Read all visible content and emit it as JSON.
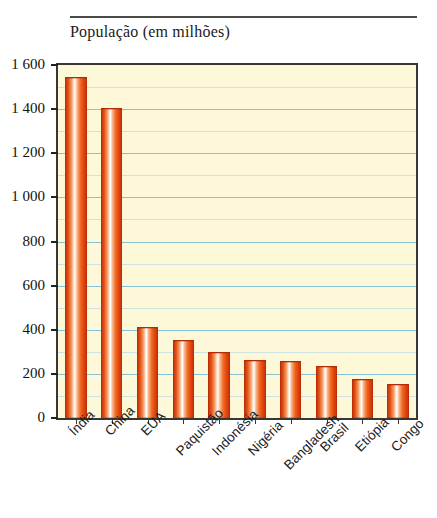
{
  "figure": {
    "title": "População (em milhões)"
  },
  "chart_data": {
    "type": "bar",
    "title": "População (em milhões)",
    "xlabel": "",
    "ylabel": "População (em milhões)",
    "ylim": [
      0,
      1600
    ],
    "ytick_step": 200,
    "minor_gridline_step": 100,
    "grid": true,
    "legend": "none",
    "categories": [
      "Índia",
      "China",
      "EUA",
      "Paquistão",
      "Indonésia",
      "Nigéria",
      "Bangladesh",
      "Brasil",
      "Etiópia",
      "Congo"
    ],
    "values": [
      1540,
      1400,
      408,
      348,
      295,
      258,
      255,
      232,
      172,
      150
    ],
    "ytick_labels": [
      "0",
      "200",
      "400",
      "600",
      "800",
      "1 000",
      "1 200",
      "1 400",
      "1 600"
    ],
    "ytick_values": [
      0,
      200,
      400,
      600,
      800,
      1000,
      1200,
      1400,
      1600
    ],
    "colors": {
      "bar_dark": "#c02d08",
      "bar_mid": "#ef6a22",
      "bar_highlight": "#ffffff",
      "plot_background": "#fcf8d8",
      "gridline": "#6fb8d4",
      "minor_gridline": "#b9d9e6",
      "frame": "#3a3733",
      "text": "#1b1b1b"
    }
  }
}
